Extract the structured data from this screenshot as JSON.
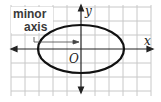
{
  "diagram": {
    "type": "ellipse-on-coordinate-grid",
    "labels": {
      "annotation_line1": "minor",
      "annotation_line2": "axis",
      "x_axis": "x",
      "y_axis": "y",
      "origin": "O"
    },
    "grid": {
      "cell_size_px": 14,
      "color": "#c8c8c8"
    },
    "ellipse": {
      "center": [
        0,
        0
      ],
      "semi_major_horizontal_units": 3,
      "semi_minor_vertical_units": 1.7,
      "stroke": "#111111"
    },
    "colors": {
      "axis": "#222222",
      "background": "#ffffff",
      "label_box": "#ffffff"
    }
  }
}
